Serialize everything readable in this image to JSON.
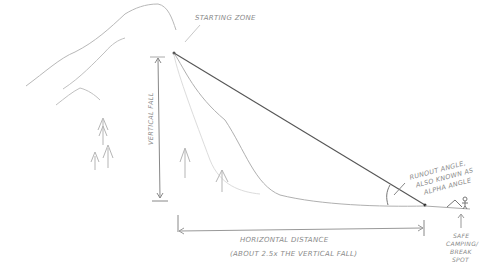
{
  "diagram": {
    "type": "hand-drawn sketch",
    "labels": {
      "starting_zone": "STARTING ZONE",
      "vertical_fall": "VERTICAL FALL",
      "horizontal_distance": "HORIZONTAL DISTANCE",
      "horizontal_note": "(ABOUT 2.5x THE VERTICAL FALL)",
      "runout_angle_line1": "RUNOUT ANGLE,",
      "runout_angle_line2": "ALSO KNOWN AS",
      "runout_angle_line3": "ALPHA ANGLE",
      "safe_spot_line1": "SAFE",
      "safe_spot_line2": "CAMPING/",
      "safe_spot_line3": "BREAK",
      "safe_spot_line4": "SPOT"
    },
    "colors": {
      "pencil_light": "#b8b8b8",
      "pencil_dark": "#555555",
      "text": "#8a8a8a"
    }
  }
}
